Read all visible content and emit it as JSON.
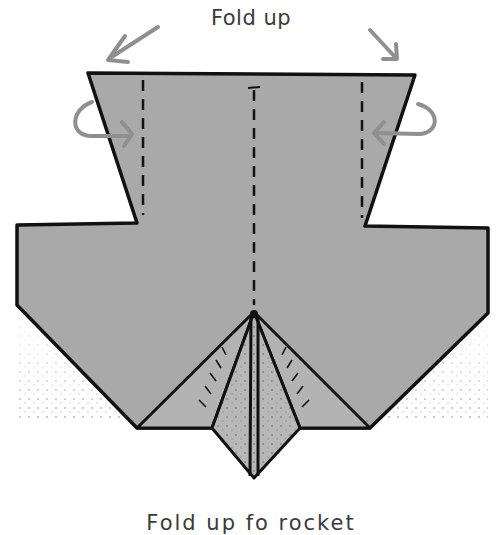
{
  "diagram": {
    "title": "Fold up",
    "caption": "Fold up fo rocket",
    "colors": {
      "paper": "#a8a8a8",
      "paper_light": "#b4b4b4",
      "outline": "#111111",
      "arrow": "#8f8f8f",
      "text": "#3a3a3a"
    },
    "elements": [
      {
        "type": "arrow",
        "label": "left-fold-up-arrow"
      },
      {
        "type": "arrow",
        "label": "right-fold-up-arrow"
      },
      {
        "type": "arrow",
        "label": "left-curl-arrow"
      },
      {
        "type": "arrow",
        "label": "right-curl-arrow"
      },
      {
        "type": "fold-line",
        "label": "left-valley-fold"
      },
      {
        "type": "fold-line",
        "label": "right-valley-fold"
      },
      {
        "type": "fold-line",
        "label": "center-valley-fold"
      },
      {
        "type": "shape",
        "label": "paper-base"
      },
      {
        "type": "shape",
        "label": "center-point-flaps"
      }
    ]
  }
}
